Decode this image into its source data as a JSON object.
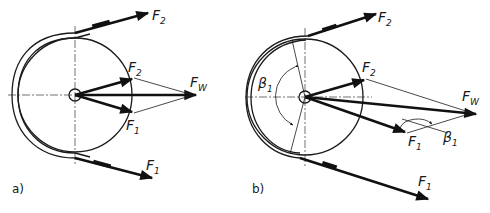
{
  "figure": {
    "panels": [
      {
        "id": "a",
        "caption": "a)",
        "labels": {
          "belt_tight": "F",
          "belt_tight_sub": "1",
          "belt_slack": "F",
          "belt_slack_sub": "2",
          "vec_f1": "F",
          "vec_f1_sub": "1",
          "vec_f2": "F",
          "vec_f2_sub": "2",
          "resultant": "F",
          "resultant_sub": "W"
        }
      },
      {
        "id": "b",
        "caption": "b)",
        "labels": {
          "belt_tight": "F",
          "belt_tight_sub": "1",
          "belt_slack": "F",
          "belt_slack_sub": "2",
          "vec_f1": "F",
          "vec_f1_sub": "1",
          "vec_f2": "F",
          "vec_f2_sub": "2",
          "resultant": "F",
          "resultant_sub": "W",
          "wrap_angle": "β",
          "wrap_angle_sub": "1",
          "angle_at_f1": "β",
          "angle_at_f1_sub": "1"
        }
      }
    ]
  }
}
